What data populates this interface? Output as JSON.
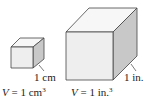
{
  "figure": {
    "small_cube": {
      "edge_label": "1 cm",
      "volume_var": "V",
      "volume_eq": " = 1 cm",
      "volume_exp": "3"
    },
    "large_cube": {
      "edge_label": "1 in.",
      "volume_var": "V",
      "volume_eq": " = 1 in.",
      "volume_exp": "3"
    },
    "colors": {
      "front_face": "#eeeeee",
      "top_face": "#f7f7f7",
      "side_face": "#c8c8c8",
      "edge": "#444444"
    }
  }
}
